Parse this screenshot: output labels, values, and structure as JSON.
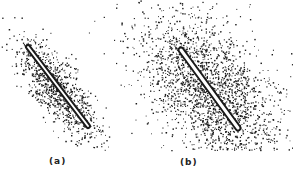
{
  "figure": {
    "background": "#ffffff",
    "ink_color": "#1a1a1a",
    "panels": [
      {
        "id": "a",
        "label": "(a)",
        "rod": {
          "x1": 28,
          "y1": 47,
          "x2": 88,
          "y2": 126,
          "width": 4
        },
        "cloud": {
          "cx": 58,
          "cy": 90,
          "half_length": 64,
          "half_width": 20,
          "dots": 950,
          "seed": 7
        }
      },
      {
        "id": "b",
        "label": "(b)",
        "rod": {
          "x1": 181,
          "y1": 50,
          "x2": 238,
          "y2": 128,
          "width": 5
        },
        "cloud": {
          "cx": 210,
          "cy": 92,
          "half_length": 92,
          "half_width": 48,
          "dots": 2300,
          "seed": 13
        }
      }
    ]
  }
}
